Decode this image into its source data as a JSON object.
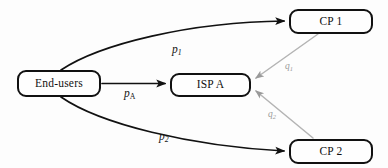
{
  "diagram": {
    "type": "network-flow-diagram",
    "background_color": "#fdfdfd",
    "node_border_color": "#111111",
    "payment_arrow_color": "#111111",
    "revenue_arrow_color": "#9a9a9a",
    "nodes": [
      {
        "id": "end-users",
        "label": "End-users",
        "x": 17,
        "y": 70,
        "width": 84,
        "height": 27
      },
      {
        "id": "isp-a",
        "label": "ISP A",
        "x": 170,
        "y": 73,
        "width": 81,
        "height": 24
      },
      {
        "id": "cp-1",
        "label": "CP 1",
        "x": 289,
        "y": 9,
        "width": 84,
        "height": 25
      },
      {
        "id": "cp-2",
        "label": "CP 2",
        "x": 289,
        "y": 139,
        "width": 84,
        "height": 25
      }
    ],
    "edges": [
      {
        "id": "p1",
        "from": "end-users",
        "to": "cp-1",
        "label_base": "p",
        "label_sub": "1",
        "color": "#111111",
        "style": "curved",
        "label_x": 172,
        "label_y": 44
      },
      {
        "id": "pA",
        "from": "end-users",
        "to": "isp-a",
        "label_base": "p",
        "label_sub": "A",
        "color": "#111111",
        "style": "straight",
        "label_x": 124,
        "label_y": 88
      },
      {
        "id": "p2",
        "from": "end-users",
        "to": "cp-2",
        "label_base": "p",
        "label_sub": "2",
        "color": "#111111",
        "style": "curved",
        "label_x": 159,
        "label_y": 131
      },
      {
        "id": "q1",
        "from": "cp-1",
        "to": "isp-a",
        "label_base": "q",
        "label_sub": "1",
        "color": "#9a9a9a",
        "style": "straight",
        "label_x": 285,
        "label_y": 62
      },
      {
        "id": "q2",
        "from": "cp-2",
        "to": "isp-a",
        "label_base": "q",
        "label_sub": "2",
        "color": "#9a9a9a",
        "style": "straight",
        "label_x": 268,
        "label_y": 110
      }
    ]
  }
}
